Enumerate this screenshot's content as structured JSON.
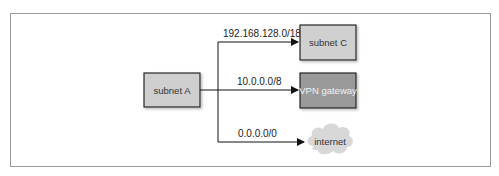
{
  "diagram": {
    "source": {
      "label": "subnet A",
      "fill": "#cfcfcf"
    },
    "routes": [
      {
        "cidr": "192.168.128.0/18",
        "target": "subnet C",
        "fill": "#d0d0d0",
        "shape": "box"
      },
      {
        "cidr": "10.0.0.0/8",
        "target": "VPN gateway",
        "fill": "#9a9a9a",
        "shape": "box"
      },
      {
        "cidr": "0.0.0.0/0",
        "target": "internet",
        "fill": "#d8d8d8",
        "shape": "cloud"
      }
    ]
  }
}
